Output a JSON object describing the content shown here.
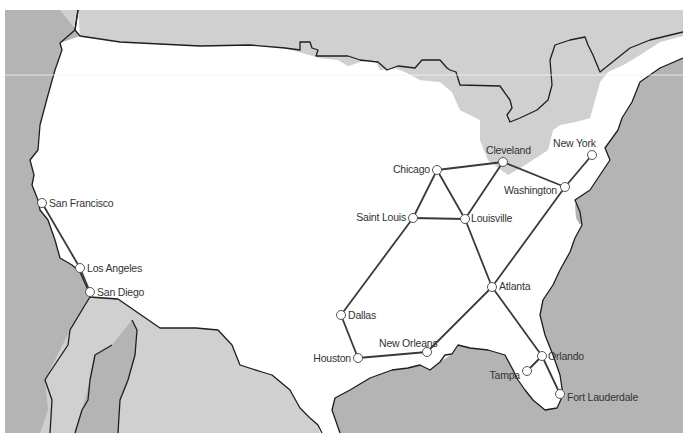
{
  "map": {
    "colors": {
      "ocean": "#b4b4b4",
      "foreign_land": "#d0d0d0",
      "usa_land": "#ffffff",
      "border": "#1e1e1e",
      "route": "#3a3a3a",
      "node_fill": "#ffffff",
      "label": "#333333"
    },
    "cities": [
      {
        "id": "sf",
        "name": "San Francisco",
        "x": 42,
        "y": 203,
        "lx": 49,
        "ly": 207,
        "anchor": "start"
      },
      {
        "id": "la",
        "name": "Los Angeles",
        "x": 80,
        "y": 268,
        "lx": 87,
        "ly": 272,
        "anchor": "start"
      },
      {
        "id": "sd",
        "name": "San Diego",
        "x": 90,
        "y": 292,
        "lx": 97,
        "ly": 296,
        "anchor": "start"
      },
      {
        "id": "chi",
        "name": "Chicago",
        "x": 437,
        "y": 170,
        "lx": 430,
        "ly": 173,
        "anchor": "end"
      },
      {
        "id": "cle",
        "name": "Cleveland",
        "x": 503,
        "y": 162,
        "lx": 486,
        "ly": 154,
        "anchor": "start"
      },
      {
        "id": "ny",
        "name": "New York",
        "x": 592,
        "y": 155,
        "lx": 553,
        "ly": 147,
        "anchor": "start"
      },
      {
        "id": "was",
        "name": "Washington",
        "x": 565,
        "y": 187,
        "lx": 557,
        "ly": 194,
        "anchor": "end"
      },
      {
        "id": "stl",
        "name": "Saint Louis",
        "x": 413,
        "y": 218,
        "lx": 406,
        "ly": 221,
        "anchor": "end"
      },
      {
        "id": "lou",
        "name": "Louisville",
        "x": 465,
        "y": 219,
        "lx": 471,
        "ly": 222,
        "anchor": "start"
      },
      {
        "id": "atl",
        "name": "Atlanta",
        "x": 492,
        "y": 287,
        "lx": 499,
        "ly": 290,
        "anchor": "start"
      },
      {
        "id": "dal",
        "name": "Dallas",
        "x": 341,
        "y": 315,
        "lx": 348,
        "ly": 319,
        "anchor": "start"
      },
      {
        "id": "hou",
        "name": "Houston",
        "x": 358,
        "y": 358,
        "lx": 351,
        "ly": 362,
        "anchor": "end"
      },
      {
        "id": "nor",
        "name": "New Orleans",
        "x": 427,
        "y": 352,
        "lx": 379,
        "ly": 347,
        "anchor": "start"
      },
      {
        "id": "orl",
        "name": "Orlando",
        "x": 542,
        "y": 356,
        "lx": 548,
        "ly": 360,
        "anchor": "start"
      },
      {
        "id": "tam",
        "name": "Tampa",
        "x": 527,
        "y": 371,
        "lx": 520,
        "ly": 379,
        "anchor": "end"
      },
      {
        "id": "ftl",
        "name": "Fort Lauderdale",
        "x": 560,
        "y": 394,
        "lx": 567,
        "ly": 401,
        "anchor": "start"
      }
    ],
    "routes": [
      [
        "sf",
        "la"
      ],
      [
        "la",
        "sd"
      ],
      [
        "chi",
        "cle"
      ],
      [
        "chi",
        "stl"
      ],
      [
        "chi",
        "lou"
      ],
      [
        "cle",
        "lou"
      ],
      [
        "cle",
        "was"
      ],
      [
        "was",
        "ny"
      ],
      [
        "was",
        "atl"
      ],
      [
        "stl",
        "lou"
      ],
      [
        "stl",
        "dal"
      ],
      [
        "dal",
        "hou"
      ],
      [
        "hou",
        "nor"
      ],
      [
        "nor",
        "atl"
      ],
      [
        "lou",
        "atl"
      ],
      [
        "atl",
        "orl"
      ],
      [
        "orl",
        "ftl"
      ],
      [
        "orl",
        "tam"
      ]
    ]
  }
}
